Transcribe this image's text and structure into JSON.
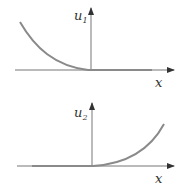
{
  "plots": [
    {
      "ylabel": "u",
      "ysub": "1",
      "xlabel": "x",
      "curve": "decaying on left, zero on right"
    },
    {
      "ylabel": "u",
      "ysub": "2",
      "xlabel": "x",
      "curve": "zero on left, growing on right"
    }
  ],
  "colors": {
    "axis": "#555555",
    "curve": "#8a8a8a"
  }
}
